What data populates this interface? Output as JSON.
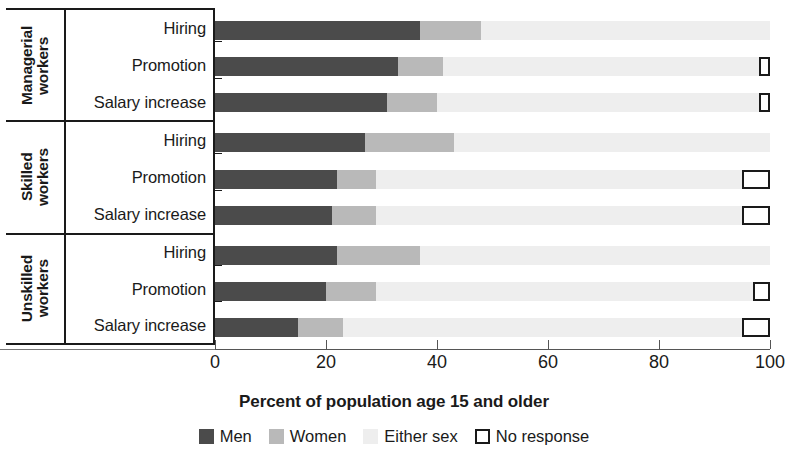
{
  "chart_data": {
    "type": "bar",
    "orientation": "horizontal",
    "stacked": true,
    "title": "",
    "xlabel": "Percent of population age 15 and older",
    "ylabel": "",
    "xlim": [
      0,
      100
    ],
    "xticks": [
      0,
      20,
      40,
      60,
      80,
      100
    ],
    "xticklabels": [
      "0",
      "20",
      "40",
      "60",
      "80",
      "100"
    ],
    "grid": false,
    "legend_position": "bottom",
    "series": [
      {
        "name": "Men",
        "color": "#4b4b4b"
      },
      {
        "name": "Women",
        "color": "#b9b9b9"
      },
      {
        "name": "Either sex",
        "color": "#eeeeee"
      },
      {
        "name": "No response",
        "color": "#ffffff"
      }
    ],
    "groups": [
      {
        "label": "Managerial\nworkers",
        "rows": [
          {
            "category": "Hiring",
            "values": {
              "Men": 37,
              "Women": 11,
              "Either sex": 52,
              "No response": 0
            }
          },
          {
            "category": "Promotion",
            "values": {
              "Men": 33,
              "Women": 8,
              "Either sex": 57,
              "No response": 2
            }
          },
          {
            "category": "Salary increase",
            "values": {
              "Men": 31,
              "Women": 9,
              "Either sex": 58,
              "No response": 2
            }
          }
        ]
      },
      {
        "label": "Skilled\nworkers",
        "rows": [
          {
            "category": "Hiring",
            "values": {
              "Men": 27,
              "Women": 16,
              "Either sex": 57,
              "No response": 0
            }
          },
          {
            "category": "Promotion",
            "values": {
              "Men": 22,
              "Women": 7,
              "Either sex": 66,
              "No response": 5
            }
          },
          {
            "category": "Salary increase",
            "values": {
              "Men": 21,
              "Women": 8,
              "Either sex": 66,
              "No response": 5
            }
          }
        ]
      },
      {
        "label": "Unskilled\nworkers",
        "rows": [
          {
            "category": "Hiring",
            "values": {
              "Men": 22,
              "Women": 15,
              "Either sex": 63,
              "No response": 0
            }
          },
          {
            "category": "Promotion",
            "values": {
              "Men": 20,
              "Women": 9,
              "Either sex": 68,
              "No response": 3
            }
          },
          {
            "category": "Salary increase",
            "values": {
              "Men": 15,
              "Women": 8,
              "Either sex": 72,
              "No response": 5
            }
          }
        ]
      }
    ]
  }
}
